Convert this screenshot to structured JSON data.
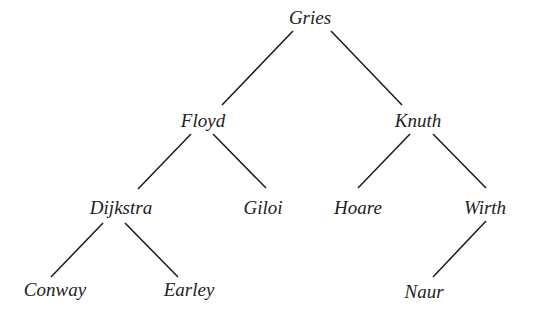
{
  "diagram": {
    "type": "tree",
    "colors": {
      "line": "#1a1a1a",
      "text": "#222222",
      "background": "#ffffff"
    },
    "nodes": {
      "gries": {
        "label": "Gries",
        "x": 310,
        "y": 24
      },
      "floyd": {
        "label": "Floyd",
        "x": 203,
        "y": 127
      },
      "knuth": {
        "label": "Knuth",
        "x": 418,
        "y": 127
      },
      "dijkstra": {
        "label": "Dijkstra",
        "x": 121,
        "y": 214
      },
      "giloi": {
        "label": "Giloi",
        "x": 263,
        "y": 214
      },
      "hoare": {
        "label": "Hoare",
        "x": 358,
        "y": 214
      },
      "wirth": {
        "label": "Wirth",
        "x": 485,
        "y": 214
      },
      "conway": {
        "label": "Conway",
        "x": 55,
        "y": 296
      },
      "earley": {
        "label": "Earley",
        "x": 189,
        "y": 296
      },
      "naur": {
        "label": "Naur",
        "x": 424,
        "y": 298
      }
    },
    "edges": [
      {
        "from": "gries",
        "to": "floyd"
      },
      {
        "from": "gries",
        "to": "knuth"
      },
      {
        "from": "floyd",
        "to": "dijkstra"
      },
      {
        "from": "floyd",
        "to": "giloi"
      },
      {
        "from": "knuth",
        "to": "hoare"
      },
      {
        "from": "knuth",
        "to": "wirth"
      },
      {
        "from": "dijkstra",
        "to": "conway"
      },
      {
        "from": "dijkstra",
        "to": "earley"
      },
      {
        "from": "wirth",
        "to": "naur"
      }
    ]
  }
}
